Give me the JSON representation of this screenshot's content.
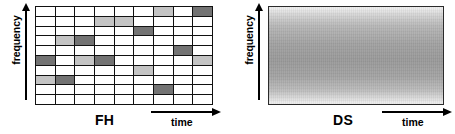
{
  "figure": {
    "panels": [
      {
        "id": "fh",
        "scheme_label": "FH",
        "scheme_name": "frequency-hopping",
        "y_axis_label": "frequency",
        "x_axis_label": "time",
        "grid": {
          "columns": 9,
          "rows": 10,
          "empty_color": "#ffffff",
          "light_color": "#c4c4c4",
          "dark_color": "#737373",
          "border_color": "#111111",
          "cells": [
            [
              "none",
              "none",
              "none",
              "none",
              "none",
              "none",
              "light",
              "none",
              "dark"
            ],
            [
              "none",
              "none",
              "none",
              "light",
              "light",
              "none",
              "none",
              "none",
              "none"
            ],
            [
              "none",
              "none",
              "none",
              "none",
              "none",
              "dark",
              "none",
              "none",
              "none"
            ],
            [
              "none",
              "light",
              "dark",
              "none",
              "none",
              "none",
              "none",
              "none",
              "none"
            ],
            [
              "none",
              "none",
              "none",
              "none",
              "none",
              "none",
              "none",
              "dark",
              "none"
            ],
            [
              "dark",
              "none",
              "light",
              "dark",
              "none",
              "none",
              "none",
              "none",
              "light"
            ],
            [
              "none",
              "none",
              "none",
              "none",
              "none",
              "light",
              "none",
              "none",
              "none"
            ],
            [
              "light",
              "dark",
              "none",
              "none",
              "none",
              "none",
              "none",
              "none",
              "none"
            ],
            [
              "none",
              "none",
              "none",
              "none",
              "none",
              "none",
              "dark",
              "none",
              "none"
            ],
            [
              "none",
              "none",
              "none",
              "none",
              "none",
              "none",
              "none",
              "none",
              "none"
            ]
          ]
        }
      },
      {
        "id": "ds",
        "scheme_label": "DS",
        "scheme_name": "direct-sequence",
        "y_axis_label": "frequency",
        "x_axis_label": "time",
        "block": {
          "fill": "vertical-gradient",
          "edge_color": "#f4f4f4",
          "center_color": "#9a9a9a",
          "border_color": "#2b2b2b"
        }
      }
    ]
  },
  "chart_data": {
    "type": "heatmap",
    "title": "",
    "xlabel": "time",
    "ylabel": "frequency",
    "panels": [
      {
        "name": "FH",
        "description": "Frequency-hopping spread spectrum: one narrow-band burst occupies a different frequency slot in each time slot.",
        "x_categories": [
          "t1",
          "t2",
          "t3",
          "t4",
          "t5",
          "t6",
          "t7",
          "t8",
          "t9"
        ],
        "y_categories": [
          "f10",
          "f9",
          "f8",
          "f7",
          "f6",
          "f5",
          "f4",
          "f3",
          "f2",
          "f1"
        ],
        "legend": [
          "none",
          "light",
          "dark"
        ],
        "values": [
          [
            0,
            0,
            0,
            0,
            0,
            0,
            1,
            0,
            2
          ],
          [
            0,
            0,
            0,
            1,
            1,
            0,
            0,
            0,
            0
          ],
          [
            0,
            0,
            0,
            0,
            0,
            2,
            0,
            0,
            0
          ],
          [
            0,
            1,
            2,
            0,
            0,
            0,
            0,
            0,
            0
          ],
          [
            0,
            0,
            0,
            0,
            0,
            0,
            0,
            2,
            0
          ],
          [
            2,
            0,
            1,
            2,
            0,
            0,
            0,
            0,
            1
          ],
          [
            0,
            0,
            0,
            0,
            0,
            1,
            0,
            0,
            0
          ],
          [
            1,
            2,
            0,
            0,
            0,
            0,
            0,
            0,
            0
          ],
          [
            0,
            0,
            0,
            0,
            0,
            0,
            2,
            0,
            0
          ],
          [
            0,
            0,
            0,
            0,
            0,
            0,
            0,
            0,
            0
          ]
        ]
      },
      {
        "name": "DS",
        "description": "Direct-sequence spread spectrum: signal energy spread continuously over the whole band for all time.",
        "x_categories": [
          "t1",
          "t9"
        ],
        "y_categories": [
          "f10",
          "f1"
        ],
        "fill": "continuous"
      }
    ],
    "grid": true,
    "legend_position": "none"
  }
}
